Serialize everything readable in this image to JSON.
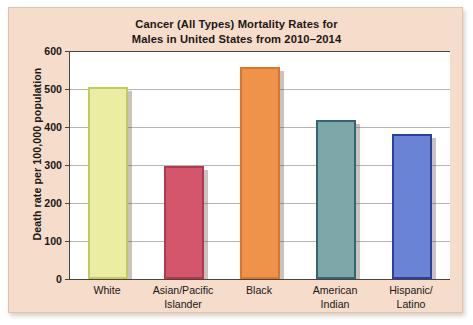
{
  "chart_data": {
    "type": "bar",
    "title_lines": [
      "Cancer (All Types) Mortality Rates for",
      "Males in United States from 2010–2014"
    ],
    "xlabel": "",
    "ylabel": "Death rate per 100,000 population",
    "ylim": [
      0,
      600
    ],
    "ytick_labels": [
      "600",
      "500",
      "400",
      "300",
      "200",
      "100",
      "0"
    ],
    "ytick_values": [
      600,
      500,
      400,
      300,
      200,
      100,
      0
    ],
    "grid": true,
    "legend": "none",
    "categories": [
      "White",
      "Asian/Pacific Islander",
      "Black",
      "American Indian",
      "Hispanic/Latino"
    ],
    "category_label_lines": [
      [
        "White"
      ],
      [
        "Asian/Pacific",
        "Islander"
      ],
      [
        "Black"
      ],
      [
        "American",
        "Indian"
      ],
      [
        "Hispanic/",
        "Latino"
      ]
    ],
    "values": [
      505,
      297,
      558,
      419,
      381
    ],
    "bar_colors": [
      "#eaeea3",
      "#d4566c",
      "#f0934a",
      "#7da7a9",
      "#6a83d4"
    ],
    "bar_edge_colors": [
      "#c3c95c",
      "#b0394f",
      "#d9762c",
      "#316672",
      "#2b3f9e"
    ]
  },
  "figure": {
    "background_color": "#ffffff",
    "panel_color": "#f6dccb",
    "plot_background_color": "#ffffff",
    "axis_color": "#4a4340",
    "gridline_color": "#b9b5b2",
    "text_color": "#201714"
  }
}
